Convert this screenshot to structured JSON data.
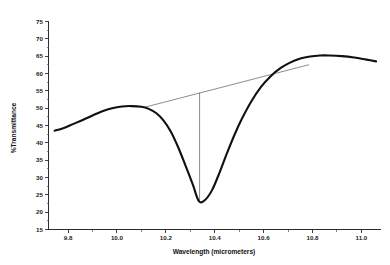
{
  "chart_data": {
    "type": "line",
    "title": "",
    "xlabel": "Wavelength (micrometers)",
    "ylabel": "%Transmittance",
    "xlim": [
      9.72,
      11.08
    ],
    "ylim": [
      15,
      75
    ],
    "grid": false,
    "legend": "none",
    "xticks": [
      "9.8",
      "10.0",
      "10.2",
      "10.4",
      "10.6",
      "10.8",
      "11.0"
    ],
    "xtick_values": [
      9.8,
      10.0,
      10.2,
      10.4,
      10.6,
      10.8,
      11.0
    ],
    "yticks": [
      "15",
      "20",
      "25",
      "30",
      "35",
      "40",
      "45",
      "50",
      "55",
      "60",
      "65",
      "70",
      "75"
    ],
    "ytick_values": [
      15,
      20,
      25,
      30,
      35,
      40,
      45,
      50,
      55,
      60,
      65,
      70,
      75
    ],
    "series": [
      {
        "name": "%Transmittance",
        "x": [
          9.745,
          9.78,
          9.82,
          9.86,
          9.9,
          9.94,
          9.98,
          10.02,
          10.06,
          10.1,
          10.13,
          10.16,
          10.19,
          10.22,
          10.25,
          10.28,
          10.31,
          10.335,
          10.36,
          10.39,
          10.42,
          10.45,
          10.48,
          10.51,
          10.55,
          10.59,
          10.63,
          10.67,
          10.71,
          10.75,
          10.79,
          10.83,
          10.87,
          10.92,
          10.97,
          11.02,
          11.06
        ],
        "values": [
          43.5,
          44.2,
          45.4,
          46.6,
          47.9,
          49.1,
          50.0,
          50.5,
          50.6,
          50.4,
          49.8,
          48.6,
          46.5,
          43.3,
          38.8,
          33.5,
          28.0,
          23.2,
          23.5,
          26.5,
          31.5,
          37.0,
          42.2,
          46.8,
          52.0,
          56.2,
          59.3,
          61.6,
          63.2,
          64.3,
          64.9,
          65.2,
          65.2,
          65.0,
          64.6,
          64.0,
          63.5
        ]
      }
    ],
    "annotations": [
      {
        "name": "baseline-tangent",
        "type": "line",
        "x": [
          10.118,
          10.786
        ],
        "y": [
          50.35,
          62.55
        ]
      },
      {
        "name": "peak-drop-line",
        "type": "vline",
        "x": 10.338,
        "y": [
          23.15,
          54.45
        ]
      }
    ]
  }
}
